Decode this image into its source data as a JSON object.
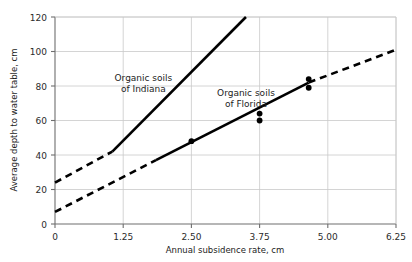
{
  "chart_data": {
    "type": "line",
    "title": "",
    "xlabel": "Annual subsidence rate, cm",
    "ylabel": "Average depth to water table, cm",
    "xlim": [
      0,
      6.25
    ],
    "ylim": [
      0,
      120
    ],
    "xticks": [
      "0",
      "1.25",
      "2.50",
      "3.75",
      "5.00",
      "6.25"
    ],
    "xtick_values": [
      0,
      1.25,
      2.5,
      3.75,
      5.0,
      6.25
    ],
    "yticks": [
      "0",
      "20",
      "40",
      "60",
      "80",
      "100",
      "120"
    ],
    "ytick_values": [
      0,
      20,
      40,
      60,
      80,
      100,
      120
    ],
    "grid": true,
    "legend_position": "inline-annotations",
    "series": [
      {
        "name": "Organic soils of Indiana",
        "annotation_line1": "Organic soils",
        "annotation_line2": "of Indiana",
        "annotation_x": 1.62,
        "annotation_y": 83,
        "color": "#000000",
        "solid_segment": {
          "x": [
            1.05,
            3.5
          ],
          "y": [
            42.0,
            120.0
          ]
        },
        "dashed_segment": {
          "x": [
            0.0,
            1.05
          ],
          "y": [
            24.0,
            42.0
          ]
        },
        "slope": 31.8,
        "intercept": 24.0,
        "points": []
      },
      {
        "name": "Organic soils of Florida",
        "annotation_line1": "Organic soils",
        "annotation_line2": "of Florida",
        "annotation_x": 3.5,
        "annotation_y": 74,
        "color": "#000000",
        "solid_segment": {
          "x": [
            1.85,
            4.65
          ],
          "y": [
            37.0,
            82.0
          ]
        },
        "dashed_segment_left": {
          "x": [
            0.0,
            1.85
          ],
          "y": [
            7.0,
            37.0
          ]
        },
        "dashed_segment_right": {
          "x": [
            4.65,
            6.25
          ],
          "y": [
            82.0,
            101.0
          ]
        },
        "slope": 15.0,
        "intercept": 7.0,
        "points": [
          {
            "x": 2.5,
            "y": 48.0
          },
          {
            "x": 3.75,
            "y": 64.0
          },
          {
            "x": 3.75,
            "y": 60.0
          },
          {
            "x": 4.65,
            "y": 84.0
          },
          {
            "x": 4.65,
            "y": 79.0
          }
        ]
      }
    ],
    "colors": {
      "axis": "#6e6e6e",
      "grid": "#c9c9c9",
      "data": "#000000",
      "text": "#1c1c1c"
    }
  }
}
